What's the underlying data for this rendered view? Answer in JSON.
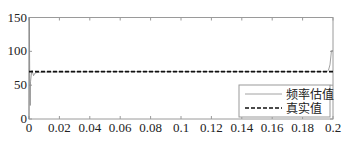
{
  "chart_data": {
    "type": "line",
    "title": "",
    "xlabel": "",
    "ylabel": "",
    "xlim": [
      0,
      0.2
    ],
    "ylim": [
      0,
      150
    ],
    "xticks": [
      0,
      0.02,
      0.04,
      0.06,
      0.08,
      0.1,
      0.12,
      0.14,
      0.16,
      0.18,
      0.2
    ],
    "xtick_labels": [
      "0",
      "0.02",
      "0.04",
      "0.06",
      "0.08",
      "0.1",
      "0.12",
      "0.14",
      "0.16",
      "0.18",
      "0.2"
    ],
    "yticks": [
      0,
      50,
      100,
      150
    ],
    "ytick_labels": [
      "0",
      "50",
      "100",
      "150"
    ],
    "grid": false,
    "legend_position": "lower right",
    "series": [
      {
        "name": "频率估值",
        "style": "solid",
        "color": "#8a8a8a",
        "x": [
          0,
          0.0002,
          0.0005,
          0.0008,
          0.001,
          0.0015,
          0.002,
          0.003,
          0.004,
          0.006,
          0.01,
          0.05,
          0.1,
          0.15,
          0.19,
          0.196,
          0.197,
          0.198,
          0.199,
          0.2
        ],
        "y": [
          0,
          150,
          60,
          20,
          55,
          65,
          72,
          64,
          68,
          69,
          69.5,
          70,
          70,
          70,
          70,
          70,
          72,
          80,
          101,
          101
        ]
      },
      {
        "name": "真实值",
        "style": "dashed",
        "color": "#111111",
        "x": [
          0,
          0.2
        ],
        "y": [
          70,
          70
        ]
      }
    ]
  },
  "legend": {
    "items": [
      {
        "label": "频率估值",
        "style": "solid"
      },
      {
        "label": "真实值",
        "style": "dashed"
      }
    ]
  }
}
